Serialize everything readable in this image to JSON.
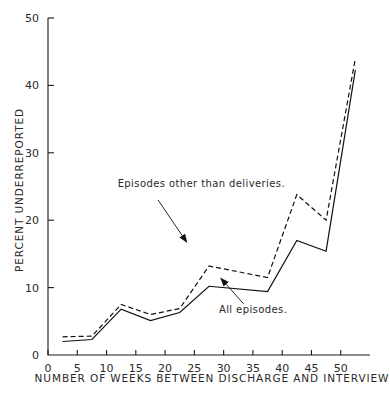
{
  "chart_data": {
    "type": "line",
    "title": "",
    "xlabel": "NUMBER OF WEEKS BETWEEN DISCHARGE AND INTERVIEW",
    "ylabel": "PERCENT UNDERREPORTED",
    "xlim": [
      0,
      55
    ],
    "ylim": [
      0,
      50
    ],
    "xticks": [
      0,
      5,
      10,
      15,
      20,
      25,
      30,
      35,
      40,
      45,
      50
    ],
    "xtick_labels": [
      "0",
      "5",
      "10",
      "15",
      "20",
      "25",
      "30",
      "35",
      "40",
      "45",
      "50"
    ],
    "yticks": [
      0,
      10,
      20,
      30,
      40,
      50
    ],
    "ytick_labels": [
      "0",
      "10",
      "20",
      "30",
      "40",
      "50"
    ],
    "grid": false,
    "legend_position": "inline-annotations",
    "x": [
      2.5,
      7.5,
      12.5,
      17.5,
      22.5,
      27.5,
      37.5,
      42.5,
      47.5,
      52.5
    ],
    "series": [
      {
        "name": "Episodes other than deliveries.",
        "style": "dashed",
        "values": [
          2.7,
          2.8,
          7.5,
          6.0,
          6.9,
          13.2,
          11.5,
          23.8,
          20.0,
          44.0
        ]
      },
      {
        "name": "All episodes.",
        "style": "solid",
        "values": [
          2.0,
          2.3,
          6.8,
          5.1,
          6.3,
          10.2,
          9.4,
          17.0,
          15.4,
          42.3
        ]
      }
    ],
    "annotations": [
      {
        "name": "episodes-other-than-deliveries",
        "text": "Episodes other than deliveries.",
        "text_x": 11.9,
        "text_y": 25.0,
        "arrow_from_x": 18.8,
        "arrow_from_y": 23.0,
        "arrow_to_x": 23.8,
        "arrow_to_y": 16.6
      },
      {
        "name": "all-episodes",
        "text": "All episodes.",
        "text_x": 29.2,
        "text_y": 6.2,
        "arrow_from_x": 33.4,
        "arrow_from_y": 7.6,
        "arrow_to_x": 29.4,
        "arrow_to_y": 11.5
      }
    ]
  },
  "colors": {
    "ink": "#111111",
    "background": "#ffffff"
  }
}
